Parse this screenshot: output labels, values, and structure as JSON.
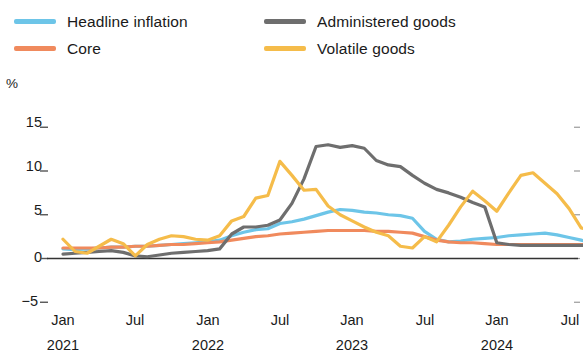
{
  "legend": {
    "items": [
      {
        "label": "Headline inflation",
        "color": "#6DC5E8",
        "name": "legend-headline-inflation"
      },
      {
        "label": "Administered goods",
        "color": "#6E6E6E",
        "name": "legend-administered-goods"
      },
      {
        "label": "Core",
        "color": "#F08A5D",
        "name": "legend-core"
      },
      {
        "label": "Volatile goods",
        "color": "#F5BC4A",
        "name": "legend-volatile-goods"
      }
    ]
  },
  "axis": {
    "unit": "%",
    "y_ticks": [
      "15",
      "10",
      "5",
      "0",
      "−5"
    ],
    "x_ticks": [
      "Jan",
      "Jul",
      "Jan",
      "Jul",
      "Jan",
      "Jul",
      "Jan",
      "Jul"
    ],
    "x_years": [
      "2021",
      "",
      "2022",
      "",
      "2023",
      "",
      "2024",
      ""
    ]
  },
  "chart_data": {
    "type": "line",
    "title": "",
    "xlabel": "",
    "ylabel": "%",
    "ylim": [
      -5,
      15
    ],
    "yticks": [
      -5,
      0,
      5,
      10,
      15
    ],
    "grid": false,
    "legend_position": "top",
    "x": [
      "2021-01",
      "2021-02",
      "2021-03",
      "2021-04",
      "2021-05",
      "2021-06",
      "2021-07",
      "2021-08",
      "2021-09",
      "2021-10",
      "2021-11",
      "2021-12",
      "2022-01",
      "2022-02",
      "2022-03",
      "2022-04",
      "2022-05",
      "2022-06",
      "2022-07",
      "2022-08",
      "2022-09",
      "2022-10",
      "2022-11",
      "2022-12",
      "2023-01",
      "2023-02",
      "2023-03",
      "2023-04",
      "2023-05",
      "2023-06",
      "2023-07",
      "2023-08",
      "2023-09",
      "2023-10",
      "2023-11",
      "2023-12",
      "2024-01",
      "2024-02",
      "2024-03",
      "2024-04",
      "2024-05",
      "2024-06",
      "2024-07",
      "2024-08",
      "2024-09"
    ],
    "series": [
      {
        "name": "Headline inflation",
        "color": "#6DC5E8",
        "values": [
          1.1,
          1.0,
          1.1,
          1.2,
          1.3,
          1.3,
          1.4,
          1.4,
          1.5,
          1.6,
          1.7,
          1.8,
          1.9,
          2.1,
          2.6,
          3.0,
          3.3,
          3.4,
          4.0,
          4.2,
          4.5,
          4.9,
          5.3,
          5.6,
          5.5,
          5.3,
          5.2,
          5.0,
          4.9,
          4.6,
          3.1,
          2.2,
          1.9,
          2.0,
          2.2,
          2.3,
          2.4,
          2.6,
          2.7,
          2.8,
          2.9,
          2.7,
          2.4,
          2.1,
          1.8
        ]
      },
      {
        "name": "Core",
        "color": "#F08A5D",
        "values": [
          1.2,
          1.2,
          1.2,
          1.2,
          1.3,
          1.3,
          1.4,
          1.4,
          1.5,
          1.6,
          1.6,
          1.7,
          1.8,
          1.9,
          2.1,
          2.3,
          2.5,
          2.6,
          2.8,
          2.9,
          3.0,
          3.1,
          3.2,
          3.2,
          3.2,
          3.2,
          3.1,
          3.1,
          3.0,
          2.9,
          2.5,
          2.1,
          1.9,
          1.8,
          1.8,
          1.7,
          1.6,
          1.6,
          1.6,
          1.6,
          1.6,
          1.6,
          1.6,
          1.6,
          1.6
        ]
      },
      {
        "name": "Administered goods",
        "color": "#6E6E6E",
        "values": [
          0.5,
          0.6,
          0.7,
          0.8,
          0.9,
          0.7,
          0.3,
          0.2,
          0.4,
          0.6,
          0.7,
          0.8,
          0.9,
          1.1,
          2.8,
          3.6,
          3.6,
          3.8,
          4.4,
          6.3,
          9.1,
          12.8,
          13.0,
          12.7,
          12.9,
          12.6,
          11.2,
          10.7,
          10.5,
          9.5,
          8.6,
          7.9,
          7.5,
          7.0,
          6.4,
          5.9,
          1.8,
          1.6,
          1.5,
          1.5,
          1.5,
          1.5,
          1.5,
          1.5,
          1.5
        ]
      },
      {
        "name": "Volatile goods",
        "color": "#F5BC4A",
        "values": [
          2.2,
          0.8,
          0.6,
          1.4,
          2.2,
          1.7,
          0.3,
          1.6,
          2.2,
          2.6,
          2.5,
          2.2,
          2.1,
          2.6,
          4.3,
          4.8,
          6.9,
          7.2,
          11.1,
          9.5,
          7.8,
          7.9,
          6.0,
          5.0,
          4.3,
          3.6,
          3.0,
          2.6,
          1.4,
          1.2,
          2.5,
          1.9,
          3.8,
          5.9,
          7.7,
          6.6,
          5.4,
          7.5,
          9.5,
          9.8,
          8.6,
          7.4,
          5.7,
          3.5,
          3.2
        ]
      }
    ]
  }
}
